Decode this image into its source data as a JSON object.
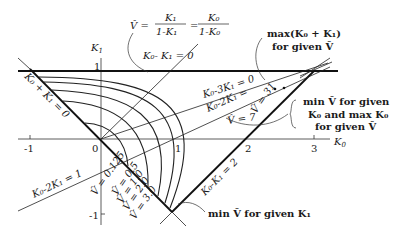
{
  "figure": {
    "axes": {
      "x_label": "K",
      "x_label_sub": "0",
      "y_label": "K",
      "y_label_sub": "1",
      "x_ticks": [
        "-1",
        "0",
        "1",
        "2",
        "3"
      ],
      "y_ticks": [
        "1",
        "-1"
      ]
    },
    "formula": {
      "lhs": "V̂ =",
      "frac1_num": "K₁",
      "frac1_den": "1-K₁",
      "eq": "=",
      "frac2_num": "K₀",
      "frac2_den": "1-K₀"
    },
    "line_labels": {
      "k0_minus_k1_eq_0": "K₀- K₁ = 0",
      "k0_plus_k1_eq_0": "K₀ + K₁ = 0",
      "k0_minus_2k1_eq_1": "K₀-2K₁ = 1",
      "k0_minus_3k1_eq_0": "K₀-3K₁ = 0",
      "k0_minus_2k1_eq": "K₀-2K₁ =",
      "k0_minus_k1_eq_2": "K₀-K₁ = 2"
    },
    "curve_labels": [
      "V̂ = 0.125",
      "V̂ = 0.5",
      "V̂ = 1.0",
      "V̂ = 2.0",
      "V̂ = 3.0"
    ],
    "v_labels": {
      "v7": "V̂ = 7",
      "v31": "V̂ = 31"
    },
    "annotations": {
      "max_line1": "max(K₀ + K₁)",
      "max_line2": "for given V̂",
      "min_given_line1": "min V̂ for given",
      "min_given_line2": "K₀ and max K₀",
      "min_given_line3": "for given V̂",
      "min_k1": "min V̂ for given K₁"
    }
  }
}
